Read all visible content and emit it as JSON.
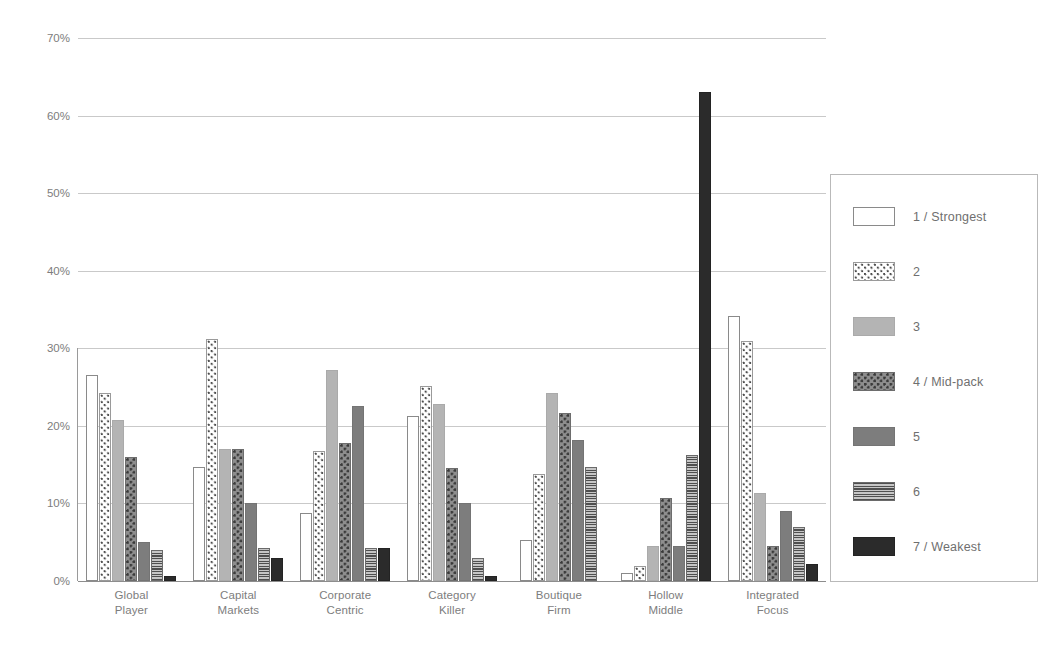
{
  "chart_data": {
    "type": "bar",
    "title": "",
    "subtitle": "",
    "xlabel": "",
    "ylabel": "",
    "ylim": [
      0,
      70
    ],
    "grid": true,
    "legend_position": "right",
    "ytick_labels": [
      "70%",
      "60%",
      "50%",
      "40%",
      "30%",
      "20%",
      "10%",
      "0%"
    ],
    "ytick_values": [
      70,
      60,
      50,
      40,
      30,
      20,
      10,
      0
    ],
    "categories": [
      "Global Player",
      "Capital Markets",
      "Corporate Centric",
      "Category Killer",
      "Boutique Firm",
      "Hollow Middle",
      "Integrated Focus"
    ],
    "category_lines": [
      [
        "Global",
        "Player"
      ],
      [
        "Capital",
        "Markets"
      ],
      [
        "Corporate",
        "Centric"
      ],
      [
        "Category",
        "Killer"
      ],
      [
        "Boutique",
        "Firm"
      ],
      [
        "Hollow",
        "Middle"
      ],
      [
        "Integrated",
        "Focus"
      ]
    ],
    "series": [
      {
        "name": "1 / Strongest",
        "swatch": "white-outline",
        "values": [
          26.5,
          14.7,
          8.8,
          21.3,
          5.3,
          1.0,
          34.2
        ]
      },
      {
        "name": "2",
        "swatch": "light-dots",
        "values": [
          24.2,
          31.2,
          16.8,
          25.2,
          13.8,
          2.0,
          31.0
        ]
      },
      {
        "name": "3",
        "swatch": "light-grey",
        "values": [
          20.7,
          17.0,
          27.2,
          22.8,
          24.2,
          4.5,
          11.3
        ]
      },
      {
        "name": "4 / Mid-pack",
        "swatch": "dark-dots",
        "values": [
          16.0,
          17.0,
          17.8,
          14.6,
          21.7,
          10.7,
          4.5
        ]
      },
      {
        "name": "5",
        "swatch": "mid-grey",
        "values": [
          5.0,
          10.0,
          22.5,
          10.0,
          18.2,
          4.5,
          9.0
        ]
      },
      {
        "name": "6",
        "swatch": "horiz-lines",
        "values": [
          4.0,
          4.2,
          4.2,
          3.0,
          14.7,
          16.3,
          7.0
        ]
      },
      {
        "name": "7 / Weakest",
        "swatch": "black",
        "values": [
          0.7,
          3.0,
          4.2,
          0.7,
          0.0,
          63.0,
          2.2
        ]
      }
    ]
  },
  "legend": {
    "items": [
      {
        "label": "1 / Strongest"
      },
      {
        "label": "2"
      },
      {
        "label": "3"
      },
      {
        "label": "4 / Mid-pack"
      },
      {
        "label": "5"
      },
      {
        "label": "6"
      },
      {
        "label": "7 / Weakest"
      }
    ]
  },
  "colors": {
    "gridline": "#c9c9c9",
    "axis": "#8d8d8d",
    "text": "#7d7d7d",
    "series_1": "#ffffff",
    "series_3": "#b4b4b4",
    "series_5": "#7d7d7d",
    "series_7": "#2b2b2b"
  }
}
